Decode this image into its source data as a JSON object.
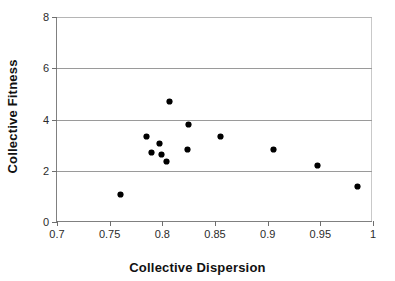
{
  "chart_data": {
    "type": "scatter",
    "title": "",
    "xlabel": "Collective Dispersion",
    "ylabel": "Collective Fitness",
    "xlim": [
      0.7,
      1
    ],
    "ylim": [
      0,
      8
    ],
    "xticks": [
      "0.7",
      "0.75",
      "0.8",
      "0.85",
      "0.9",
      "0.95",
      "1"
    ],
    "xtick_values": [
      0.7,
      0.75,
      0.8,
      0.85,
      0.9,
      0.95,
      1
    ],
    "yticks": [
      "0",
      "2",
      "4",
      "6",
      "8"
    ],
    "ytick_values": [
      0,
      2,
      4,
      6,
      8
    ],
    "grid": "horizontal",
    "legend": "none",
    "marker_style": "filled-diamond-black",
    "series": [
      {
        "name": "Collective Fitness vs Collective Dispersion",
        "points": [
          {
            "x": 0.76,
            "y": 1.09
          },
          {
            "x": 0.785,
            "y": 3.32
          },
          {
            "x": 0.79,
            "y": 2.73
          },
          {
            "x": 0.797,
            "y": 3.08
          },
          {
            "x": 0.799,
            "y": 2.62
          },
          {
            "x": 0.804,
            "y": 2.38
          },
          {
            "x": 0.807,
            "y": 4.69
          },
          {
            "x": 0.824,
            "y": 2.81
          },
          {
            "x": 0.825,
            "y": 3.81
          },
          {
            "x": 0.855,
            "y": 3.32
          },
          {
            "x": 0.906,
            "y": 2.81
          },
          {
            "x": 0.947,
            "y": 2.22
          },
          {
            "x": 0.985,
            "y": 1.37
          }
        ]
      }
    ],
    "colors": {
      "marker": "#000000",
      "gridline": "#9a9a9a",
      "axis": "#808080",
      "text": "#1a1a1a",
      "background": "#ffffff"
    }
  }
}
